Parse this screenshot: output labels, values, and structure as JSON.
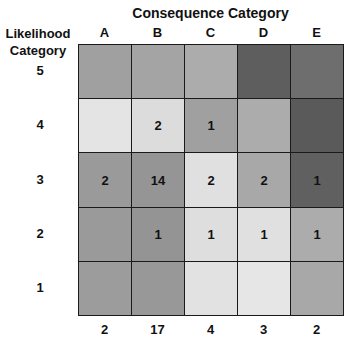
{
  "chart_data": {
    "type": "heatmap",
    "title": "Consequence Category",
    "xlabel": "Consequence Category",
    "ylabel": "Likelihood Category",
    "x_categories": [
      "A",
      "B",
      "C",
      "D",
      "E"
    ],
    "y_categories": [
      "5",
      "4",
      "3",
      "2",
      "1"
    ],
    "cells": [
      [
        {
          "count": "",
          "shade": "#a0a0a0"
        },
        {
          "count": "",
          "shade": "#a4a4a4"
        },
        {
          "count": "",
          "shade": "#acacac"
        },
        {
          "count": "",
          "shade": "#5e5e5e"
        },
        {
          "count": "",
          "shade": "#6e6e6e"
        }
      ],
      [
        {
          "count": "",
          "shade": "#e4e4e4"
        },
        {
          "count": "2",
          "shade": "#dcdcdc"
        },
        {
          "count": "1",
          "shade": "#a0a0a0"
        },
        {
          "count": "",
          "shade": "#acacac"
        },
        {
          "count": "",
          "shade": "#5a5a5a"
        }
      ],
      [
        {
          "count": "2",
          "shade": "#9a9a9a"
        },
        {
          "count": "14",
          "shade": "#959595"
        },
        {
          "count": "2",
          "shade": "#e0e0e0"
        },
        {
          "count": "2",
          "shade": "#a8a8a8"
        },
        {
          "count": "1",
          "shade": "#606060"
        }
      ],
      [
        {
          "count": "",
          "shade": "#9a9a9a"
        },
        {
          "count": "1",
          "shade": "#949494"
        },
        {
          "count": "1",
          "shade": "#dedede"
        },
        {
          "count": "1",
          "shade": "#e0e0e0"
        },
        {
          "count": "1",
          "shade": "#acacac"
        }
      ],
      [
        {
          "count": "",
          "shade": "#9c9c9c"
        },
        {
          "count": "",
          "shade": "#989898"
        },
        {
          "count": "",
          "shade": "#e2e2e2"
        },
        {
          "count": "",
          "shade": "#e6e6e6"
        },
        {
          "count": "",
          "shade": "#a8a8a8"
        }
      ]
    ],
    "column_totals": [
      "2",
      "17",
      "4",
      "3",
      "2"
    ],
    "legend": "none",
    "grid": true
  }
}
